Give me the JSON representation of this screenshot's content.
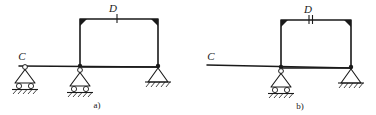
{
  "figure": {
    "background_color": "#ffffff",
    "ink_color": "#1a1a1a"
  },
  "diagram_a": {
    "caption": "a)",
    "labels": {
      "left_point": "C",
      "top_point": "D"
    },
    "hinge_marker": {
      "name": "single-tick",
      "tick_count": 1
    },
    "supports": [
      {
        "index": 0,
        "type": "roller",
        "label": "C"
      },
      {
        "index": 1,
        "type": "roller",
        "label": ""
      },
      {
        "index": 2,
        "type": "pinned",
        "label": ""
      }
    ]
  },
  "diagram_b": {
    "caption": "b)",
    "labels": {
      "left_point": "C",
      "top_point": "D"
    },
    "hinge_marker": {
      "name": "double-tick",
      "tick_count": 2
    },
    "supports": [
      {
        "index": 0,
        "type": "roller",
        "label": ""
      },
      {
        "index": 1,
        "type": "pinned",
        "label": ""
      }
    ]
  }
}
